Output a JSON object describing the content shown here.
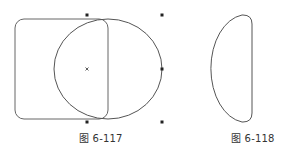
{
  "figures": [
    {
      "id": "fig-6-117",
      "caption": "图 6-117",
      "description": "Rounded rectangle overlapping a circle; circle shows selection handles and center mark",
      "shapes": [
        "rounded-rectangle",
        "circle"
      ],
      "handles": [
        "top-middle",
        "top-right",
        "middle-right",
        "bottom-middle",
        "bottom-right",
        "center"
      ]
    },
    {
      "id": "fig-6-118",
      "caption": "图 6-118",
      "description": "Resulting D-shaped intersection of the circle and rounded rectangle",
      "shapes": [
        "intersection-shape"
      ]
    }
  ],
  "colors": {
    "stroke": "#555555",
    "handle": "#222222",
    "text": "#333333",
    "background": "#ffffff"
  }
}
